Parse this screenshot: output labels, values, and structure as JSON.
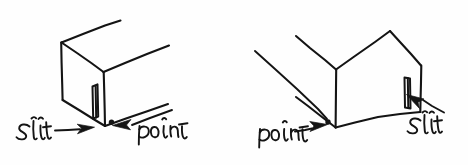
{
  "figure": {
    "background_color": "#fefefe",
    "ink_color": "#141414",
    "width": 468,
    "height": 165,
    "style": "handwritten pen sketch, line drawing, no fill"
  },
  "panels": [
    {
      "id": "left-panel",
      "name": "left-box-diagram",
      "description": "Open-ended rectangular box drawn in oblique projection, viewed so the front vertical face is on the left; a narrow vertical slit sits on that front face and a point marker sits at the lower right of the face.",
      "box": {
        "name": "left-box",
        "open_face_direction": "upper-right",
        "front_face_side": "left"
      },
      "slit": {
        "name": "left-slit",
        "orientation": "vertical",
        "face": "front-left-face",
        "label": "slit"
      },
      "point": {
        "name": "left-point",
        "marker": "dot",
        "label": "point"
      },
      "labels": [
        {
          "id": "left-label-slit",
          "text": "slit",
          "anchor": "left",
          "arrow": "points-right"
        },
        {
          "id": "left-label-point",
          "text": "point",
          "anchor": "right",
          "arrow": "points-left"
        }
      ]
    },
    {
      "id": "right-panel",
      "name": "right-box-diagram",
      "description": "The same open-ended rectangular box mirrored, viewed so the front vertical face is on the right; the narrow vertical slit sits on the right face and the point marker sits at the lower left corner.",
      "box": {
        "name": "right-box",
        "open_face_direction": "upper-left",
        "front_face_side": "right"
      },
      "slit": {
        "name": "right-slit",
        "orientation": "vertical",
        "face": "right-face",
        "label": "slit"
      },
      "point": {
        "name": "right-point",
        "marker": "dot",
        "label": "point"
      },
      "labels": [
        {
          "id": "right-label-point",
          "text": "point",
          "anchor": "left",
          "arrow": "points-right"
        },
        {
          "id": "right-label-slit",
          "text": "slit",
          "anchor": "right",
          "arrow": "points-left"
        }
      ]
    }
  ],
  "text_items": {
    "left_slit": "slit",
    "left_point": "point",
    "right_point": "point",
    "right_slit": "slit"
  }
}
